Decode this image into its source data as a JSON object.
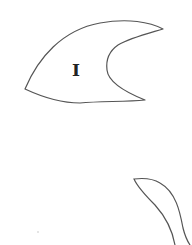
{
  "diagram": {
    "shapes": [
      {
        "id": "piece-1",
        "label": "I",
        "type": "closed-outline",
        "description": "crescent/fin-shaped fragment with concave notch on right side"
      },
      {
        "id": "piece-2",
        "label": "",
        "type": "open-outline",
        "description": "partial leaf-shaped fragment at bottom right, cut off by image edge"
      }
    ],
    "colors": {
      "stroke": "#555555",
      "label": "#222222",
      "background": "#ffffff"
    }
  }
}
